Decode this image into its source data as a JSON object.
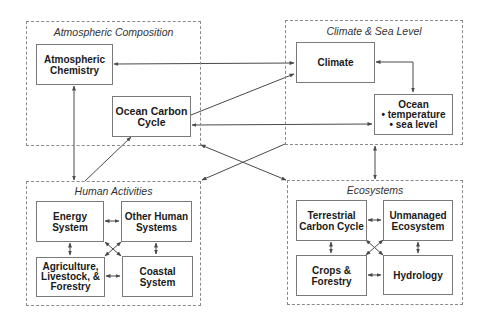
{
  "groups": {
    "atmospheric_composition": {
      "title": "Atmospheric Composition"
    },
    "climate_sea_level": {
      "title": "Climate & Sea Level"
    },
    "human_activities": {
      "title": "Human Activities"
    },
    "ecosystems": {
      "title": "Ecosystems"
    }
  },
  "nodes": {
    "atmospheric_chemistry": {
      "lines": [
        "Atmospheric",
        "Chemistry"
      ]
    },
    "ocean_carbon_cycle": {
      "lines": [
        "Ocean Carbon",
        "Cycle"
      ]
    },
    "climate": {
      "lines": [
        "Climate"
      ]
    },
    "ocean": {
      "lines": [
        "Ocean",
        "• temperature",
        "• sea level"
      ]
    },
    "energy_system": {
      "lines": [
        "Energy",
        "System"
      ]
    },
    "other_human_systems": {
      "lines": [
        "Other Human",
        "Systems"
      ]
    },
    "agriculture": {
      "lines": [
        "Agriculture,",
        "Livestock, &",
        "Forestry"
      ]
    },
    "coastal_system": {
      "lines": [
        "Coastal",
        "System"
      ]
    },
    "terrestrial_carbon_cycle": {
      "lines": [
        "Terrestrial",
        "Carbon Cycle"
      ]
    },
    "unmanaged_ecosystem": {
      "lines": [
        "Unmanaged",
        "Ecosystem"
      ]
    },
    "crops_forestry": {
      "lines": [
        "Crops &",
        "Forestry"
      ]
    },
    "hydrology": {
      "lines": [
        "Hydrology"
      ]
    }
  },
  "connections": [
    {
      "from": "climate",
      "to": "atmospheric_chemistry",
      "type": "bidirectional"
    },
    {
      "from": "ocean_carbon_cycle",
      "to": "climate",
      "type": "directed"
    },
    {
      "from": "ocean",
      "to": "ocean_carbon_cycle",
      "type": "bidirectional"
    },
    {
      "from": "climate",
      "to": "ocean",
      "type": "bidirectional"
    },
    {
      "from": "atmospheric_chemistry",
      "to": "human_activities",
      "type": "bidirectional"
    },
    {
      "from": "human_activities",
      "to": "ocean_carbon_cycle",
      "type": "directed"
    },
    {
      "from": "climate_sea_level",
      "to": "human_activities",
      "type": "directed"
    },
    {
      "from": "atmospheric_composition",
      "to": "ecosystems",
      "type": "bidirectional"
    },
    {
      "from": "climate_sea_level",
      "to": "ecosystems",
      "type": "bidirectional"
    },
    {
      "from": "energy_system",
      "to": "other_human_systems",
      "type": "bidirectional"
    },
    {
      "from": "energy_system",
      "to": "agriculture",
      "type": "bidirectional"
    },
    {
      "from": "other_human_systems",
      "to": "coastal_system",
      "type": "bidirectional"
    },
    {
      "from": "agriculture",
      "to": "coastal_system",
      "type": "bidirectional"
    },
    {
      "from": "energy_system",
      "to": "coastal_system",
      "type": "bidirectional"
    },
    {
      "from": "other_human_systems",
      "to": "agriculture",
      "type": "bidirectional"
    },
    {
      "from": "terrestrial_carbon_cycle",
      "to": "unmanaged_ecosystem",
      "type": "bidirectional"
    },
    {
      "from": "terrestrial_carbon_cycle",
      "to": "crops_forestry",
      "type": "bidirectional"
    },
    {
      "from": "unmanaged_ecosystem",
      "to": "hydrology",
      "type": "bidirectional"
    },
    {
      "from": "crops_forestry",
      "to": "hydrology",
      "type": "bidirectional"
    },
    {
      "from": "terrestrial_carbon_cycle",
      "to": "hydrology",
      "type": "bidirectional"
    },
    {
      "from": "unmanaged_ecosystem",
      "to": "crops_forestry",
      "type": "bidirectional"
    }
  ],
  "colors": {
    "line": "#4a4a4a",
    "box_border": "#7a7a7a",
    "dash": "#8a8a8a"
  }
}
